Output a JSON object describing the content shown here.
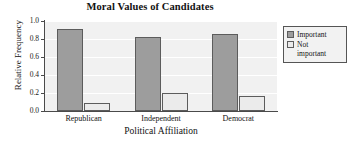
{
  "chart_data": {
    "type": "bar",
    "title": "Moral Values of Candidates",
    "xlabel": "Political Affiliation",
    "ylabel": "Relative Frequency",
    "categories": [
      "Republican",
      "Independent",
      "Democrat"
    ],
    "series": [
      {
        "name": "Important",
        "values": [
          0.91,
          0.82,
          0.86
        ],
        "color": "#9d9d9d"
      },
      {
        "name": "Not important",
        "values": [
          0.09,
          0.2,
          0.17
        ],
        "color": "#ebebeb"
      }
    ],
    "ylim": [
      0.0,
      1.0
    ],
    "yticks": [
      "0.0",
      "0.2",
      "0.4",
      "0.6",
      "0.8",
      "1.0"
    ],
    "ytick_values": [
      0.0,
      0.2,
      0.4,
      0.6,
      0.8,
      1.0
    ],
    "grid": true,
    "grid_color": "#ffffff",
    "plot_background": "#f1f1f1",
    "legend_position": "right",
    "legend_entries": [
      "Important",
      "Not important"
    ],
    "legend_entries_wrapped": [
      [
        "Important"
      ],
      [
        "Not",
        "important"
      ]
    ]
  }
}
